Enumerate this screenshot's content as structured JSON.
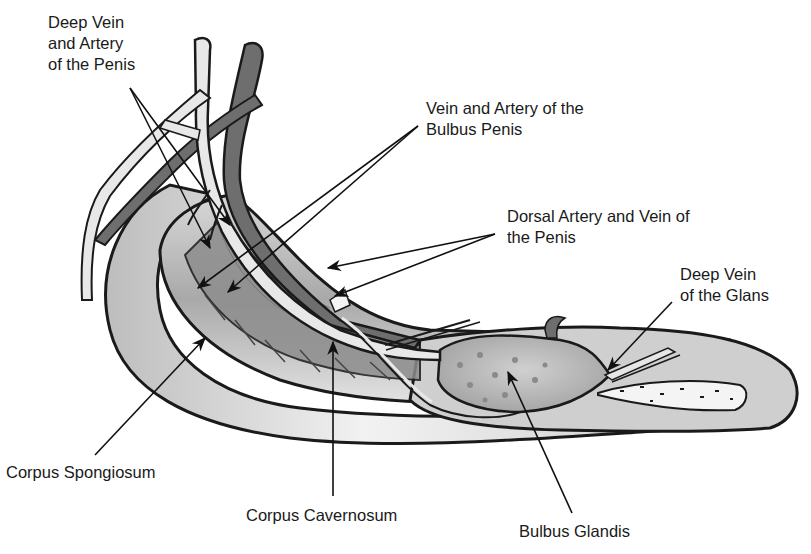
{
  "diagram": {
    "labels": [
      {
        "id": "deep-vein-artery-penis",
        "lines": [
          "Deep Vein",
          "and Artery",
          "of the Penis"
        ]
      },
      {
        "id": "vein-artery-bulbus-penis",
        "lines": [
          "Vein and Artery of the",
          "Bulbus Penis"
        ]
      },
      {
        "id": "dorsal-artery-vein-penis",
        "lines": [
          "Dorsal Artery and Vein of",
          "the Penis"
        ]
      },
      {
        "id": "deep-vein-glans",
        "lines": [
          "Deep Vein",
          "of the Glans"
        ]
      },
      {
        "id": "corpus-spongiosum",
        "lines": [
          "Corpus Spongiosum"
        ]
      },
      {
        "id": "corpus-cavernosum",
        "lines": [
          "Corpus Cavernosum"
        ]
      },
      {
        "id": "bulbus-glandis",
        "lines": [
          "Bulbus Glandis"
        ]
      }
    ],
    "colors": {
      "outline": "#1a1a1a",
      "light_fill": "#e4e4e4",
      "mid_fill": "#b5b5b5",
      "dark_fill": "#6e6e6e",
      "bone": "#f4f4f4"
    }
  }
}
